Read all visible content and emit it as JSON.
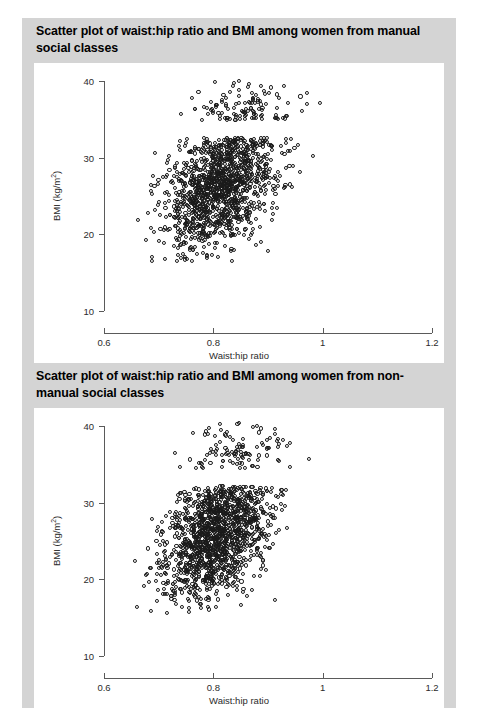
{
  "figure": {
    "background_color": "#d4d4d4",
    "panel_color": "#ffffff",
    "marker_color": "#1a1a1a",
    "axis_color": "#5a5a5a"
  },
  "panels": [
    {
      "title": "Scatter plot of waist:hip ratio and BMI among women from manual social classes",
      "xlabel": "Waist:hip ratio",
      "ylabel_main": "BMI (kg/m",
      "ylabel_sup": "2",
      "ylabel_close": ")"
    },
    {
      "title": "Scatter plot of waist:hip ratio and BMI among women from non-manual social classes",
      "xlabel": "Waist:hip ratio",
      "ylabel_main": "BMI (kg/m",
      "ylabel_sup": "2",
      "ylabel_close": ")"
    }
  ],
  "chart_data": [
    {
      "type": "scatter",
      "title": "Scatter plot of waist:hip ratio and BMI among women from manual social classes",
      "xlabel": "Waist:hip ratio",
      "ylabel": "BMI (kg/m2)",
      "xlim": [
        0.6,
        1.2
      ],
      "ylim": [
        10,
        40
      ],
      "xticks": [
        0.6,
        0.8,
        1,
        1.2
      ],
      "xtick_labels": [
        "0.6",
        "0.8",
        "1",
        "1.2"
      ],
      "yticks": [
        10,
        20,
        30,
        40
      ],
      "ytick_labels": [
        "10",
        "20",
        "30",
        "40"
      ],
      "grid": false,
      "legend": null,
      "marker": "open-circle",
      "n_points": 1400,
      "distribution": {
        "x_mean": 0.818,
        "x_sd": 0.052,
        "y_mean": 26.6,
        "y_sd": 4.3,
        "correlation": 0.42,
        "x_min_observed": 0.655,
        "x_max_observed": 1.12,
        "y_min_observed": 16.3,
        "y_max_observed": 40.2
      },
      "seed": 1371
    },
    {
      "type": "scatter",
      "title": "Scatter plot of waist:hip ratio and BMI among women from non-manual social classes",
      "xlabel": "Waist:hip ratio",
      "ylabel": "BMI (kg/m2)",
      "xlim": [
        0.6,
        1.2
      ],
      "ylim": [
        10,
        40
      ],
      "xticks": [
        0.6,
        0.8,
        1,
        1.2
      ],
      "xtick_labels": [
        "0.6",
        "0.8",
        "1",
        "1.2"
      ],
      "yticks": [
        10,
        20,
        30,
        40
      ],
      "ytick_labels": [
        "10",
        "20",
        "30",
        "40"
      ],
      "grid": false,
      "legend": null,
      "marker": "open-circle",
      "n_points": 1500,
      "distribution": {
        "x_mean": 0.805,
        "x_sd": 0.05,
        "y_mean": 26.0,
        "y_sd": 4.4,
        "correlation": 0.4,
        "x_min_observed": 0.608,
        "x_max_observed": 1.15,
        "y_min_observed": 15.6,
        "y_max_observed": 40.5
      },
      "seed": 8821
    }
  ]
}
